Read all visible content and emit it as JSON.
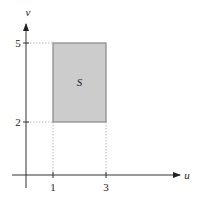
{
  "diagram": {
    "type": "region-in-uv-plane",
    "axes": {
      "x_label": "u",
      "y_label": "v"
    },
    "x_ticks": [
      "1",
      "3"
    ],
    "y_ticks": [
      "2",
      "5"
    ],
    "region": {
      "label": "S",
      "u_range": [
        1,
        3
      ],
      "v_range": [
        2,
        5
      ],
      "fill": "#cccccc",
      "stroke": "#888888"
    }
  }
}
